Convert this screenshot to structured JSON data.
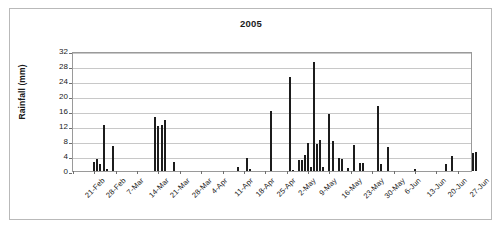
{
  "chart_data": {
    "type": "bar",
    "title": "2005",
    "xlabel": "",
    "ylabel": "Rainfall (mm)",
    "ylim": [
      0,
      32
    ],
    "ytick_values": [
      0,
      4,
      8,
      12,
      16,
      20,
      24,
      28,
      32
    ],
    "ytick_labels": [
      "0",
      "4",
      "8",
      "12",
      "16",
      "20",
      "24",
      "28",
      "32"
    ],
    "grid": true,
    "legend": false,
    "x_start_label": "21-Feb",
    "x_tick_interval_days": 7,
    "x_total_days": 131,
    "xtick_labels": [
      "21-Feb",
      "28-Feb",
      "7-Mar",
      "14-Mar",
      "21-Mar",
      "28-Mar",
      "4-Apr",
      "11-Apr",
      "18-Apr",
      "25-Apr",
      "2-May",
      "9-May",
      "16-May",
      "23-May",
      "30-May",
      "6-Jun",
      "13-Jun",
      "20-Jun",
      "27-Jun"
    ],
    "series": [
      {
        "name": "Rainfall",
        "color": "#1c1c1c",
        "points": [
          {
            "day": 7,
            "label": "28-Feb",
            "value": 2.4
          },
          {
            "day": 8,
            "label": "1-Mar",
            "value": 3.2
          },
          {
            "day": 9,
            "label": "2-Mar",
            "value": 2.0
          },
          {
            "day": 10,
            "label": "3-Mar",
            "value": 12.3
          },
          {
            "day": 11,
            "label": "4-Mar",
            "value": 0.5
          },
          {
            "day": 13,
            "label": "6-Mar",
            "value": 6.7
          },
          {
            "day": 27,
            "label": "20-Mar",
            "value": 14.4
          },
          {
            "day": 28,
            "label": "21-Mar",
            "value": 11.9
          },
          {
            "day": 29,
            "label": "22-Mar",
            "value": 12.2
          },
          {
            "day": 30,
            "label": "23-Mar",
            "value": 13.6
          },
          {
            "day": 33,
            "label": "26-Mar",
            "value": 2.5
          },
          {
            "day": 54,
            "label": "16-Apr",
            "value": 1.2
          },
          {
            "day": 57,
            "label": "19-Apr",
            "value": 3.5
          },
          {
            "day": 58,
            "label": "20-Apr",
            "value": 0.6
          },
          {
            "day": 65,
            "label": "27-Apr",
            "value": 16.1
          },
          {
            "day": 71,
            "label": "3-May",
            "value": 25.2
          },
          {
            "day": 72,
            "label": "4-May",
            "value": 0.4
          },
          {
            "day": 74,
            "label": "6-May",
            "value": 2.9
          },
          {
            "day": 75,
            "label": "7-May",
            "value": 3.0
          },
          {
            "day": 76,
            "label": "8-May",
            "value": 4.3
          },
          {
            "day": 77,
            "label": "9-May",
            "value": 7.4
          },
          {
            "day": 78,
            "label": "10-May",
            "value": 1.1
          },
          {
            "day": 79,
            "label": "11-May",
            "value": 29.2
          },
          {
            "day": 80,
            "label": "12-May",
            "value": 7.1
          },
          {
            "day": 81,
            "label": "13-May",
            "value": 8.2
          },
          {
            "day": 82,
            "label": "14-May",
            "value": 1.0
          },
          {
            "day": 84,
            "label": "16-May",
            "value": 15.2
          },
          {
            "day": 85,
            "label": "17-May",
            "value": 8.1
          },
          {
            "day": 87,
            "label": "19-May",
            "value": 3.4
          },
          {
            "day": 88,
            "label": "20-May",
            "value": 3.3
          },
          {
            "day": 90,
            "label": "22-May",
            "value": 0.9
          },
          {
            "day": 92,
            "label": "24-May",
            "value": 7.0
          },
          {
            "day": 94,
            "label": "26-May",
            "value": 2.2
          },
          {
            "day": 95,
            "label": "27-May",
            "value": 2.2
          },
          {
            "day": 100,
            "label": "1-Jun",
            "value": 17.4
          },
          {
            "day": 101,
            "label": "2-Jun",
            "value": 1.8
          },
          {
            "day": 103,
            "label": "4-Jun",
            "value": 6.5
          },
          {
            "day": 112,
            "label": "13-Jun",
            "value": 0.6
          },
          {
            "day": 122,
            "label": "23-Jun",
            "value": 1.9
          },
          {
            "day": 124,
            "label": "25-Jun",
            "value": 4.0
          },
          {
            "day": 131,
            "label": "2-Jul",
            "value": 4.8
          },
          {
            "day": 132,
            "label": "3-Jul",
            "value": 5.0
          },
          {
            "day": 141,
            "label": "12-Jul",
            "value": 2.3
          },
          {
            "day": 142,
            "label": "13-Jul",
            "value": 2.2
          },
          {
            "day": 147,
            "label": "18-Jul",
            "value": 4.2
          },
          {
            "day": 151,
            "label": "22-Jul",
            "value": 1.5
          },
          {
            "day": 153,
            "label": "24-Jul",
            "value": 14.8
          },
          {
            "day": 155,
            "label": "26-Jul",
            "value": 15.2
          },
          {
            "day": 157,
            "label": "28-Jul",
            "value": 8.3
          }
        ]
      }
    ]
  }
}
